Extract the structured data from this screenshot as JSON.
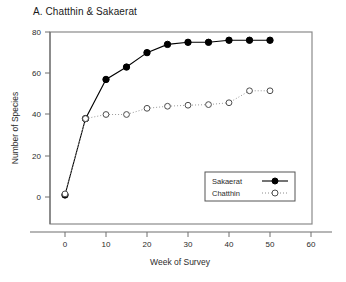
{
  "chart_data": {
    "type": "line",
    "title": "A. Chatthin & Sakaerat",
    "xlabel": "Week of Survey",
    "ylabel": "Number of Species",
    "xlim": [
      -5,
      60
    ],
    "ylim": [
      -18,
      80
    ],
    "xticks": [
      0,
      10,
      20,
      30,
      40,
      50,
      60
    ],
    "yticks": [
      0,
      20,
      40,
      60,
      80
    ],
    "xtick_labels": [
      "0",
      "10",
      "20",
      "30",
      "40",
      "50",
      "60"
    ],
    "ytick_labels": [
      "0",
      "20",
      "40",
      "60",
      "80"
    ],
    "grid": false,
    "legend_position": "lower right",
    "series": [
      {
        "name": "Sakaerat",
        "marker": "filled-circle",
        "line_style": "solid",
        "color": "#000000",
        "x": [
          0,
          5,
          10,
          15,
          20,
          25,
          30,
          35,
          40,
          45,
          50
        ],
        "y": [
          1,
          38,
          57,
          63,
          70,
          74,
          75,
          75,
          76,
          76,
          76
        ]
      },
      {
        "name": "Chatthin",
        "marker": "open-circle",
        "line_style": "dotted",
        "color": "#000000",
        "x": [
          0,
          5,
          10,
          15,
          20,
          25,
          30,
          35,
          40,
          45,
          50
        ],
        "y": [
          1.5,
          38,
          40,
          40,
          43,
          44,
          44.5,
          44.8,
          45.7,
          51.5,
          51.5
        ]
      }
    ]
  },
  "legend": {
    "entries": [
      {
        "label": "Sakaerat"
      },
      {
        "label": "Chatthin"
      }
    ]
  }
}
